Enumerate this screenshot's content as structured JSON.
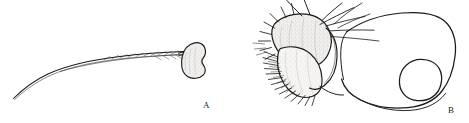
{
  "figure": {
    "type": "scientific-line-drawing",
    "background_color": "#ffffff",
    "ink_color": "#1a1a1a",
    "stipple_fill_color": "#e8e6e4",
    "width": 469,
    "height": 123,
    "panels": [
      {
        "id": "A",
        "label": "A",
        "subject": "antenna",
        "description": "Long curved antennal shaft bearing fine hairs, terminating distally in a kidney-shaped stippled antennal club",
        "parts": [
          {
            "name": "antennal-scape-shaft",
            "description": "slender elongate curved shaft"
          },
          {
            "name": "antennal-hairs",
            "description": "fine short setae along shaft"
          },
          {
            "name": "antennal-club",
            "description": "bean/kidney-shaped apical club with stippled shading"
          }
        ]
      },
      {
        "id": "B",
        "label": "B",
        "subject": "head-and-maxillary-palp-lateral",
        "description": "Lateral view of head capsule with circular foramen, bearing stippled palp segments with radiating long setae and a dense comb of short setae",
        "parts": [
          {
            "name": "head-capsule-outline",
            "description": "large rounded head capsule outline"
          },
          {
            "name": "eye-foramen-circle",
            "description": "circular eye or occipital foramen"
          },
          {
            "name": "palp-segment-proximal",
            "description": "stippled proximal palp segment"
          },
          {
            "name": "palp-segment-distal",
            "description": "stippled distal palp segment"
          },
          {
            "name": "long-setae",
            "description": "long crossing setae arising dorsally"
          },
          {
            "name": "setal-comb",
            "description": "dense row of short comb-like setae on ventro-lateral margin"
          }
        ]
      }
    ]
  }
}
